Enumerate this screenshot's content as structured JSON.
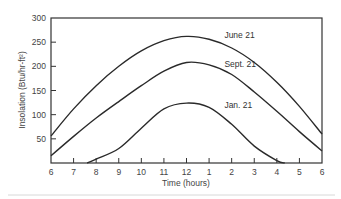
{
  "chart_data": {
    "type": "line",
    "title": "",
    "xlabel": "Time (hours)",
    "ylabel": "Insolation (Btu/hr-ft²)",
    "x_tick_labels": [
      "6",
      "7",
      "8",
      "9",
      "10",
      "11",
      "12",
      "1",
      "2",
      "3",
      "4",
      "5",
      "6"
    ],
    "y_ticks": [
      50,
      100,
      150,
      200,
      250,
      300
    ],
    "y_tick_labels": [
      "50",
      "100",
      "150",
      "200",
      "250",
      "300"
    ],
    "xlim": [
      6,
      18
    ],
    "ylim": [
      0,
      300
    ],
    "grid": false,
    "legend": "inline labels on curves",
    "x_unit": "hour of day (24h, 6 = 6 AM, 18 = 6 PM)",
    "series": [
      {
        "name": "June 21",
        "x": [
          6,
          7,
          8,
          9,
          10,
          11,
          12,
          13,
          14,
          15,
          16,
          17,
          18
        ],
        "values": [
          56,
          112,
          160,
          200,
          232,
          253,
          262,
          256,
          238,
          208,
          167,
          117,
          60
        ]
      },
      {
        "name": "Sept. 21",
        "x": [
          6,
          7,
          8,
          9,
          10,
          11,
          12,
          13,
          14,
          15,
          16,
          17,
          18
        ],
        "values": [
          15,
          55,
          93,
          127,
          160,
          190,
          208,
          203,
          183,
          147,
          107,
          65,
          25
        ]
      },
      {
        "name": "Jan. 21",
        "x": [
          7.6,
          8,
          9,
          10,
          11,
          12,
          13,
          14,
          15,
          16,
          16.35
        ],
        "values": [
          0,
          8,
          30,
          72,
          112,
          124,
          115,
          80,
          35,
          5,
          0
        ]
      }
    ],
    "annotations": [
      {
        "text": "June 21",
        "x": 13.5,
        "y": 265
      },
      {
        "text": "Sept. 21",
        "x": 13.5,
        "y": 205
      },
      {
        "text": "Jan. 21",
        "x": 13.5,
        "y": 120
      }
    ]
  }
}
